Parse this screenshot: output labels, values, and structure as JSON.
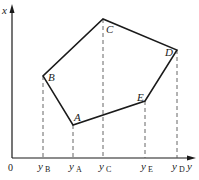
{
  "diagram": {
    "axes": {
      "vertical_label": "x",
      "horizontal_label": "y",
      "origin_label": "0"
    },
    "vertices": [
      {
        "name": "A",
        "x": 73,
        "y": 125,
        "tick_label": "y",
        "tick_sub": "A"
      },
      {
        "name": "B",
        "x": 43,
        "y": 76,
        "tick_label": "y",
        "tick_sub": "B"
      },
      {
        "name": "C",
        "x": 103,
        "y": 19,
        "tick_label": "y",
        "tick_sub": "C"
      },
      {
        "name": "D",
        "x": 177,
        "y": 50,
        "tick_label": "y",
        "tick_sub": "D"
      },
      {
        "name": "E",
        "x": 145,
        "y": 101,
        "tick_label": "y",
        "tick_sub": "E"
      }
    ],
    "polygon_order": [
      "A",
      "B",
      "C",
      "D",
      "E"
    ],
    "colors": {
      "line": "#1a1a1a",
      "dashed": "#555555",
      "background": "#ffffff"
    }
  }
}
